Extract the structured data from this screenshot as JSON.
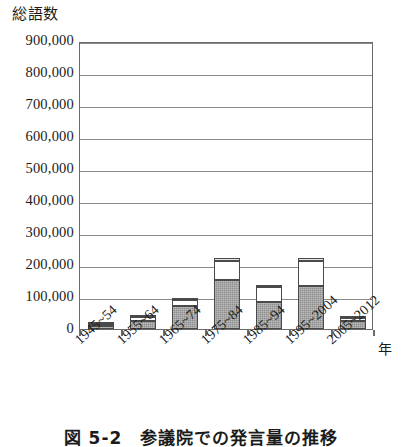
{
  "figure": {
    "caption": "図 5-2　参議院での発言量の推移",
    "y_axis_title": "総語数",
    "x_axis_unit": "年"
  },
  "chart_data": {
    "type": "bar",
    "stacked": true,
    "title": "図 5-2　参議院での発言量の推移",
    "xlabel": "年",
    "ylabel": "総語数",
    "ylim": [
      0,
      900000
    ],
    "ytick_step": 100000,
    "grid": true,
    "legend": "none",
    "categories": [
      "1945~54",
      "1955~64",
      "1965~74",
      "1975~84",
      "1985~94",
      "1995~2004",
      "2005~2012"
    ],
    "ytick_labels": [
      "0",
      "100,000",
      "200,000",
      "300,000",
      "400,000",
      "500,000",
      "600,000",
      "700,000",
      "800,000",
      "900,000"
    ],
    "series": [
      {
        "name": "segment-dark",
        "values": [
          9000,
          24000,
          72000,
          152000,
          83000,
          133000,
          26000
        ]
      },
      {
        "name": "segment-white",
        "values": [
          8000,
          15000,
          18000,
          62000,
          49000,
          80000,
          9000
        ]
      },
      {
        "name": "segment-light",
        "values": [
          3000,
          4000,
          8000,
          8000,
          6000,
          8000,
          4000
        ]
      }
    ],
    "totals": [
      20000,
      43000,
      98000,
      222000,
      138000,
      221000,
      39000
    ]
  },
  "colors": {
    "segment_dark": "#8e8e8e",
    "segment_white": "#ffffff",
    "segment_light": "#cfcfcf",
    "axis": "#6b6b6b",
    "gridline": "#8a8a8a",
    "text": "#1b1b1b"
  }
}
